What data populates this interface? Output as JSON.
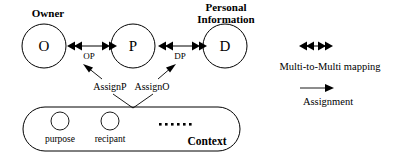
{
  "diagram": {
    "nodes": [
      {
        "id": "O",
        "letter": "O",
        "caption": "Owner"
      },
      {
        "id": "P",
        "letter": "P",
        "caption": ""
      },
      {
        "id": "D",
        "letter": "D",
        "caption_line1": "Personal",
        "caption_line2": "Information"
      }
    ],
    "edges": [
      {
        "id": "OP",
        "label": "OP",
        "from": "O",
        "to": "P",
        "kind": "multi-to-multi"
      },
      {
        "id": "DP",
        "label": "DP",
        "from": "P",
        "to": "D",
        "kind": "multi-to-multi"
      }
    ],
    "assignments": [
      {
        "id": "AssignP",
        "label": "AssignP",
        "target": "OP"
      },
      {
        "id": "AssignO",
        "label": "AssignO",
        "target": "DP"
      }
    ],
    "context": {
      "label": "Context",
      "items": [
        {
          "label": "purpose"
        },
        {
          "label": "recipant"
        }
      ],
      "ellipsis": "......",
      "ellipsis_dot_count": 6
    },
    "legend": [
      {
        "id": "multi-to-multi",
        "label": "Multi-to-Multi mapping",
        "symbol": "double-headed-arrow"
      },
      {
        "id": "assignment",
        "label": "Assignment",
        "symbol": "single-arrow"
      }
    ],
    "colors": {
      "stroke": "#000000",
      "background": "#ffffff",
      "text": "#000000"
    }
  }
}
